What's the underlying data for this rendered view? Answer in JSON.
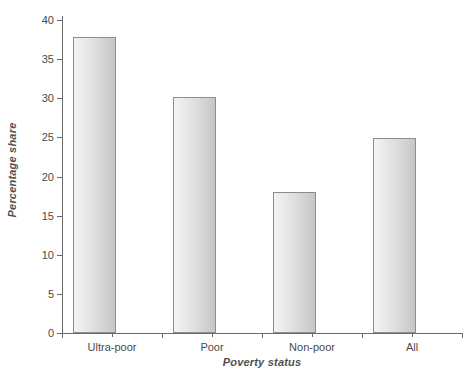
{
  "chart_data": {
    "type": "bar",
    "title": "",
    "subtitle": "",
    "xlabel": "Poverty status",
    "ylabel": "Percentage share",
    "categories": [
      "Ultra-poor",
      "Poor",
      "Non-poor",
      "All"
    ],
    "values": [
      37.8,
      30.2,
      18.0,
      24.9
    ],
    "series": [
      {
        "name": "Percentage share",
        "values": [
          37.8,
          30.2,
          18.0,
          24.9
        ]
      }
    ],
    "ylim": [
      0,
      40
    ],
    "ytick_labels": [
      "0",
      "5",
      "10",
      "15",
      "20",
      "25",
      "30",
      "35",
      "40"
    ],
    "ytick_values": [
      0,
      5,
      10,
      15,
      20,
      25,
      30,
      35,
      40
    ],
    "grid": false,
    "legend": false,
    "legend_position": "none",
    "annotations": [],
    "colors": {
      "bar_fill_light": "#f4f4f4",
      "bar_fill_dark": "#c6c6c6",
      "bar_border": "#8d8d8d",
      "axis": "#6b6b6b",
      "text": "#4a4a4a",
      "background": "#ffffff"
    }
  }
}
